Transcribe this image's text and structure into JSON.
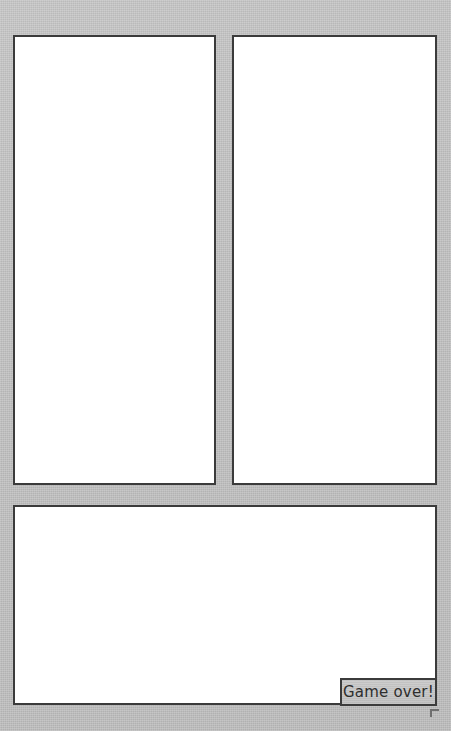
{
  "app": {
    "background_color": "#c5c5c5",
    "panel_fill_color": "#ffffff",
    "panel_border_color": "#3b3b3b"
  },
  "panels": [
    {
      "name": "left-panel",
      "label": ""
    },
    {
      "name": "right-panel",
      "label": ""
    },
    {
      "name": "bottom-panel",
      "label": ""
    }
  ],
  "status": {
    "message": "Game over!",
    "text_color": "#2e2e2e",
    "box_fill_color": "#c6c6c6",
    "box_border_color": "#3b3b3b"
  }
}
